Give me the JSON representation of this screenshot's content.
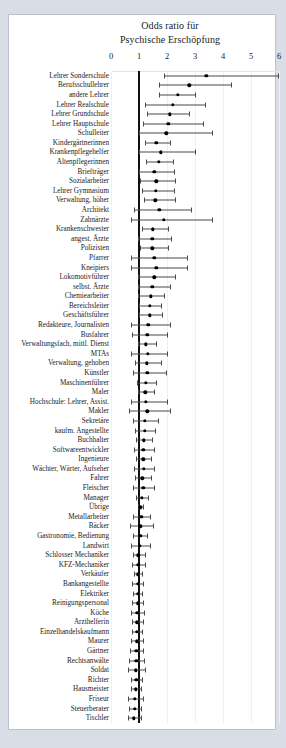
{
  "chart_data": {
    "type": "scatter",
    "title": "Odds ratio für Psychische Erschöpfung",
    "title_lines": [
      "Odds ratio für",
      "Psychische Erschöpfung"
    ],
    "xlabel": "",
    "ylabel": "",
    "xlim": [
      0,
      6
    ],
    "xticks": [
      0,
      1,
      2,
      3,
      4,
      5,
      6
    ],
    "xtick_labels": [
      "0",
      "1",
      "2",
      "3",
      "4",
      "5",
      "6"
    ],
    "reference_line": 1,
    "grid": true,
    "legend": "none",
    "series_name": "Odds ratio (95% CI)",
    "categories": [
      "Lehrer Sonderschule",
      "Berufsschullehrer",
      "andere Lehrer",
      "Lehrer Realschule",
      "Lehrer Grundschule",
      "Lehrer Hauptschule",
      "Schulleiter",
      "Kindergärtnerinnen",
      "Krankenpflegehelfer",
      "Altenpflegerinnen",
      "Briefträger",
      "Sozialarbeiter",
      "Lehrer Gymnasium",
      "Verwaltung, höher",
      "Architekt",
      "Zahnärzte",
      "Krankenschwester",
      "angest. Ärzte",
      "Polizisten",
      "Pfarrer",
      "Kneipiers",
      "Lokomotivführer",
      "selbst. Ärzte",
      "Chemiearbeiter",
      "Bereichsleiter",
      "Geschäftsführer",
      "Redakteure, Journalisten",
      "Busfahrer",
      "Verwaltungsfach, mittl. Dienst",
      "MTAs",
      "Verwaltung, gehoben",
      "Künstler",
      "Maschinenführer",
      "Maler",
      "Hochschule: Lehrer, Assist.",
      "Makler",
      "Sekretäre",
      "kaufm. Angestellte",
      "Buchhalter",
      "Softwareentwickler",
      "Ingenieure",
      "Wächter, Wärter, Aufseher",
      "Fahrer",
      "Fleischer",
      "Manager",
      "Übrige",
      "Metallarbeiter",
      "Bäcker",
      "Gastronomie, Bedienung",
      "Landwirt",
      "Schlosser Mechaniker",
      "KFZ-Mechaniker",
      "Verkäufer",
      "Bankangestellte",
      "Elektriker",
      "Reinigungspersonal",
      "Köche",
      "Arzthelferin",
      "Einzelhandelskaufmann",
      "Maurer",
      "Gärtner",
      "Rechtsanwälte",
      "Soldat",
      "Richter",
      "Hausmeister",
      "Friseur",
      "Steuerberater",
      "Tischler"
    ],
    "values": [
      3.4,
      2.8,
      2.38,
      2.2,
      2.1,
      2.05,
      1.98,
      1.62,
      1.78,
      1.7,
      1.55,
      1.62,
      1.6,
      1.58,
      1.72,
      1.88,
      1.5,
      1.48,
      1.47,
      1.55,
      1.62,
      1.55,
      1.48,
      1.42,
      1.38,
      1.38,
      1.33,
      1.3,
      1.25,
      1.32,
      1.27,
      1.3,
      1.25,
      1.22,
      1.25,
      1.3,
      1.2,
      1.2,
      1.18,
      1.16,
      1.15,
      1.18,
      1.12,
      1.15,
      1.1,
      1.05,
      1.08,
      1.05,
      1.04,
      1.02,
      0.98,
      0.97,
      0.96,
      0.95,
      0.95,
      0.95,
      0.94,
      0.93,
      0.92,
      0.92,
      0.9,
      0.9,
      0.88,
      0.9,
      0.88,
      0.86,
      0.85,
      0.82
    ],
    "ci_low": [
      1.9,
      1.72,
      1.72,
      1.2,
      1.28,
      1.13,
      1.0,
      1.22,
      1.0,
      1.25,
      1.0,
      1.03,
      1.12,
      1.18,
      0.82,
      0.73,
      1.12,
      0.98,
      1.02,
      0.72,
      0.72,
      0.98,
      0.95,
      0.98,
      1.0,
      1.0,
      0.72,
      0.75,
      0.96,
      0.72,
      0.86,
      0.78,
      0.92,
      0.95,
      0.7,
      0.66,
      0.8,
      0.86,
      0.9,
      0.82,
      0.88,
      0.82,
      0.85,
      0.78,
      0.9,
      0.96,
      0.8,
      0.68,
      0.8,
      0.72,
      0.78,
      0.76,
      0.82,
      0.76,
      0.8,
      0.76,
      0.72,
      0.74,
      0.76,
      0.7,
      0.68,
      0.66,
      0.62,
      0.72,
      0.7,
      0.62,
      0.64,
      0.62
    ],
    "ci_high": [
      5.95,
      4.3,
      3.0,
      3.35,
      2.8,
      3.3,
      3.6,
      2.1,
      3.0,
      2.2,
      2.25,
      2.3,
      2.25,
      2.3,
      2.85,
      3.6,
      2.02,
      2.15,
      2.05,
      2.7,
      2.7,
      2.3,
      2.1,
      1.88,
      1.8,
      1.82,
      2.1,
      2.0,
      1.6,
      2.0,
      1.78,
      1.95,
      1.62,
      1.52,
      2.0,
      2.1,
      1.68,
      1.58,
      1.48,
      1.52,
      1.44,
      1.55,
      1.42,
      1.55,
      1.32,
      1.13,
      1.38,
      1.5,
      1.3,
      1.4,
      1.22,
      1.2,
      1.12,
      1.15,
      1.12,
      1.15,
      1.18,
      1.14,
      1.1,
      1.14,
      1.16,
      1.18,
      1.22,
      1.1,
      1.08,
      1.14,
      1.08,
      1.06
    ]
  }
}
